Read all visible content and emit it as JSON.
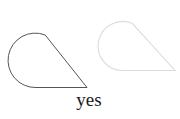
{
  "canvas": {
    "width": 180,
    "height": 119,
    "background": "#ffffff"
  },
  "caption": {
    "text": "yes",
    "color": "#1a1a1a"
  },
  "shapes": [
    {
      "name": "left-teardrop-outline",
      "path": "M 45.2 35 L 87 87.5 L 36 87.5 A 27.2 27.2 0 1 1 45.2 35 Z",
      "stroke": "#555555",
      "stroke_width": "1"
    },
    {
      "name": "right-teardrop-outline-faded",
      "path": "M 132.5 23.6 L 175 70.5 L 122.5 70.5 A 24.5 24.5 0 1 1 132.5 23.6 Z",
      "stroke": "#dcdcdc",
      "stroke_width": "1.1"
    }
  ]
}
